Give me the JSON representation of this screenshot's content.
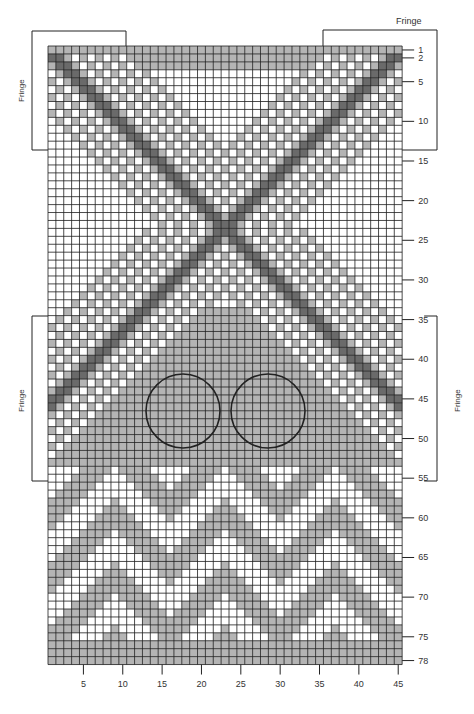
{
  "chart_data": {
    "type": "heatmap",
    "title": "",
    "grid": {
      "columns": 45,
      "rows": 78,
      "left": 48,
      "top": 46,
      "cell_w": 7.87,
      "cell_h": 7.93
    },
    "colors": {
      "white": "#ffffff",
      "gray": "#b4b4b4",
      "dark": "#6a6a6a",
      "gridline": "#1e1e1e"
    },
    "x_ticks": [
      5,
      10,
      15,
      20,
      25,
      30,
      35,
      40,
      45
    ],
    "y_ticks": [
      1,
      2,
      5,
      10,
      15,
      20,
      25,
      30,
      35,
      40,
      45,
      50,
      55,
      60,
      65,
      70,
      75,
      78
    ],
    "circles": [
      {
        "cx": 183,
        "cy": 411,
        "r": 37
      },
      {
        "cx": 268,
        "cy": 411,
        "r": 37
      }
    ],
    "annotations": [
      {
        "text": "Fringe",
        "position": "top-right",
        "x": 408,
        "y": 22
      },
      {
        "text": "Fringe",
        "position": "left-upper",
        "x": 20,
        "y": 90,
        "rotated": true
      },
      {
        "text": "Fringe",
        "position": "left-lower",
        "x": 20,
        "y": 398,
        "rotated": true
      },
      {
        "text": "Fringe",
        "position": "right-lower",
        "x": 456,
        "y": 398,
        "rotated": true
      }
    ],
    "brackets": [
      {
        "name": "top-left",
        "x1": 32,
        "y1": 31,
        "x2": 126,
        "y2": 150
      },
      {
        "name": "top-right",
        "x1": 323,
        "y1": 30,
        "x2": 437,
        "y2": 150
      },
      {
        "name": "left-lower",
        "x1": 32,
        "y1": 316,
        "x2": 48,
        "y2": 481
      },
      {
        "name": "right-lower",
        "x1": 437,
        "y1": 316,
        "x2": 421,
        "y2": 481
      }
    ],
    "motif": {
      "x_cross_row": 23,
      "x_cross_col": 23,
      "dark_band_width": 2,
      "stripe_period": 2,
      "gray_fill_start_row": 34,
      "chevron_start_row": 54,
      "chevron_peaks": [
        9,
        23,
        37
      ],
      "chevron_band_height": 4
    }
  },
  "labels": {
    "fringe_top": "Fringe",
    "fringe_left_upper": "Fringe",
    "fringe_left_lower": "Fringe",
    "fringe_right_lower": "Fringe"
  }
}
